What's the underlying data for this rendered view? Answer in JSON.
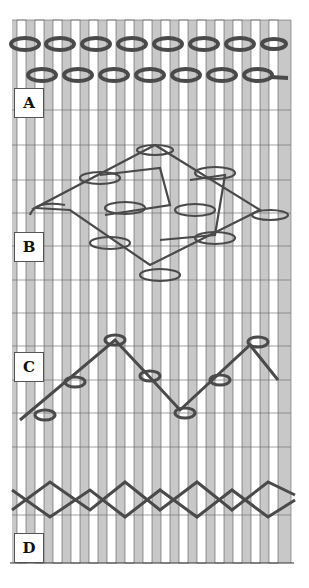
{
  "figure": {
    "type": "textile weaving structure diagram",
    "panels": [
      {
        "id": "A",
        "label": "A",
        "description": "two rows of chain-like twined weft over warps"
      },
      {
        "id": "B",
        "label": "B",
        "description": "diamond lattice of looped wefts"
      },
      {
        "id": "C",
        "label": "C",
        "description": "zigzag single weft with loops"
      },
      {
        "id": "D",
        "label": "D",
        "description": "crossed weft pairs (X-twining)"
      }
    ],
    "colors": {
      "background": "#ffffff",
      "ground": "#c8c8c8",
      "warp": "#ffffff",
      "outline": "#555555",
      "weft": "#4a4a4a"
    },
    "warp_count": 16
  }
}
